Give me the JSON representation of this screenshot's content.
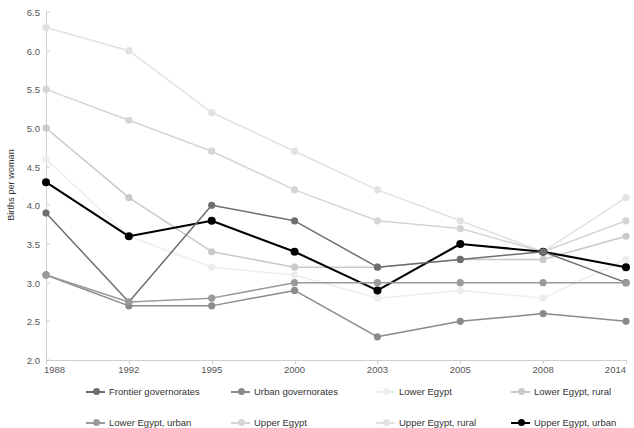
{
  "chart_title": "",
  "axis": {
    "ylabel": "Births per woman",
    "xlabel": "",
    "yticks": [
      "6.5",
      "6.0",
      "5.5",
      "5.0",
      "4.5",
      "4.0",
      "3.5",
      "3.0",
      "2.5",
      "2.0"
    ],
    "xticks": [
      "1988",
      "1992",
      "1995",
      "2000",
      "2003",
      "2005",
      "2008",
      "2014"
    ]
  },
  "legend": {
    "rows": [
      [
        {
          "label": "Frontier governorates",
          "color": "#6e6e6e"
        },
        {
          "label": "Urban governorates",
          "color": "#8a8a8a"
        },
        {
          "label": "Lower Egypt",
          "color": "#ededed"
        },
        {
          "label": "Lower Egypt, rural",
          "color": "#c9c9c9"
        }
      ],
      [
        {
          "label": "Lower Egypt, urban",
          "color": "#9a9a9a"
        },
        {
          "label": "Upper Egypt",
          "color": "#d5d5d5"
        },
        {
          "label": "Upper Egypt, rural",
          "color": "#e2e2e2"
        },
        {
          "label": "Upper Egypt, urban",
          "color": "#000000"
        }
      ]
    ]
  },
  "chart_data": {
    "type": "line",
    "title": "",
    "xlabel": "",
    "ylabel": "Births per woman",
    "ylim": [
      2.0,
      6.5
    ],
    "grid": false,
    "legend_position": "bottom",
    "categories": [
      "1988",
      "1992",
      "1995",
      "2000",
      "2003",
      "2005",
      "2008",
      "2014"
    ],
    "series": [
      {
        "name": "Upper Egypt, rural",
        "color": "#e2e2e2",
        "values": [
          6.3,
          6.0,
          5.2,
          4.7,
          4.2,
          3.8,
          3.4,
          4.1
        ]
      },
      {
        "name": "Upper Egypt",
        "color": "#d5d5d5",
        "values": [
          5.5,
          5.1,
          4.7,
          4.2,
          3.8,
          3.7,
          3.4,
          3.8
        ]
      },
      {
        "name": "Lower Egypt, rural",
        "color": "#c9c9c9",
        "values": [
          5.0,
          4.1,
          3.4,
          3.2,
          3.2,
          3.3,
          3.3,
          3.6
        ]
      },
      {
        "name": "Lower Egypt",
        "color": "#ededed",
        "values": [
          4.6,
          3.6,
          3.2,
          3.1,
          2.8,
          2.9,
          2.8,
          3.3
        ]
      },
      {
        "name": "Upper Egypt, urban",
        "color": "#000000",
        "values": [
          4.3,
          3.6,
          3.8,
          3.4,
          2.9,
          3.5,
          3.4,
          3.2
        ]
      },
      {
        "name": "Frontier governorates",
        "color": "#6e6e6e",
        "values": [
          3.9,
          2.75,
          4.0,
          3.8,
          3.2,
          3.3,
          3.4,
          3.0
        ]
      },
      {
        "name": "Urban governorates",
        "color": "#8a8a8a",
        "values": [
          3.1,
          2.7,
          2.7,
          2.9,
          2.3,
          2.5,
          2.6,
          2.5
        ]
      },
      {
        "name": "Lower Egypt, urban",
        "color": "#9a9a9a",
        "values": [
          3.1,
          2.75,
          2.8,
          3.0,
          3.0,
          3.0,
          3.0,
          3.0
        ]
      }
    ]
  }
}
